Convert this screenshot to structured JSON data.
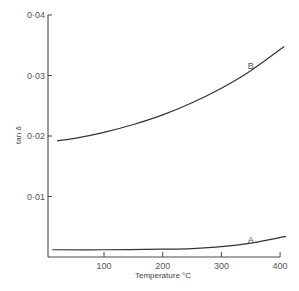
{
  "chart_data": {
    "type": "line",
    "title": "",
    "xlabel": "Temperature °C",
    "ylabel": "tan δ",
    "xlim": [
      0,
      400
    ],
    "ylim": [
      0,
      0.04
    ],
    "x_ticks": [
      100,
      200,
      300,
      400
    ],
    "x_tick_labels": [
      "100",
      "200",
      "300",
      "400"
    ],
    "y_ticks": [
      0.01,
      0.02,
      0.03,
      0.04
    ],
    "y_tick_labels": [
      "0·01",
      "0·02",
      "0·03",
      "0·04"
    ],
    "grid": false,
    "legend": "inline labels at curve ends",
    "series": [
      {
        "name": "B",
        "x": [
          20,
          50,
          100,
          150,
          200,
          250,
          300,
          350,
          407
        ],
        "y": [
          0.0192,
          0.0196,
          0.0206,
          0.0219,
          0.0235,
          0.0255,
          0.0279,
          0.0308,
          0.0348
        ],
        "label_at": [
          350,
          0.0318
        ]
      },
      {
        "name": "A",
        "x": [
          12,
          100,
          200,
          250,
          300,
          350,
          410
        ],
        "y": [
          0.0012,
          0.0012,
          0.0013,
          0.0014,
          0.0017,
          0.0023,
          0.0034
        ],
        "label_at": [
          350,
          0.003
        ]
      }
    ]
  },
  "labels": {
    "x_axis_title": "Temperature °C",
    "y_axis_title": "tan δ",
    "curve_b": "B",
    "curve_a": "A"
  }
}
